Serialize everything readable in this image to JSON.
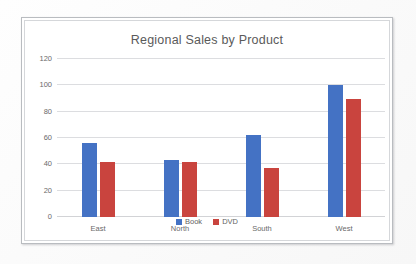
{
  "chart_data": {
    "type": "bar",
    "title": "Regional Sales by Product",
    "categories": [
      "East",
      "North",
      "South",
      "West"
    ],
    "series": [
      {
        "name": "Book",
        "color": "#4472C4",
        "values": [
          56,
          43,
          62,
          100
        ]
      },
      {
        "name": "DVD",
        "color": "#C9443E",
        "values": [
          42,
          42,
          37,
          90
        ]
      }
    ],
    "xlabel": "",
    "ylabel": "",
    "ylim": [
      0,
      120
    ],
    "yticks": [
      0,
      20,
      40,
      60,
      80,
      100,
      120
    ],
    "grid": true,
    "legend_position": "bottom"
  },
  "style": {
    "gridline_color": "#DCDDE0",
    "tick_text_color": "#6A6A6A",
    "title_color": "#5A5A5A",
    "frame_color": "#B9BCC0",
    "plot_background": "#FFFFFF"
  }
}
